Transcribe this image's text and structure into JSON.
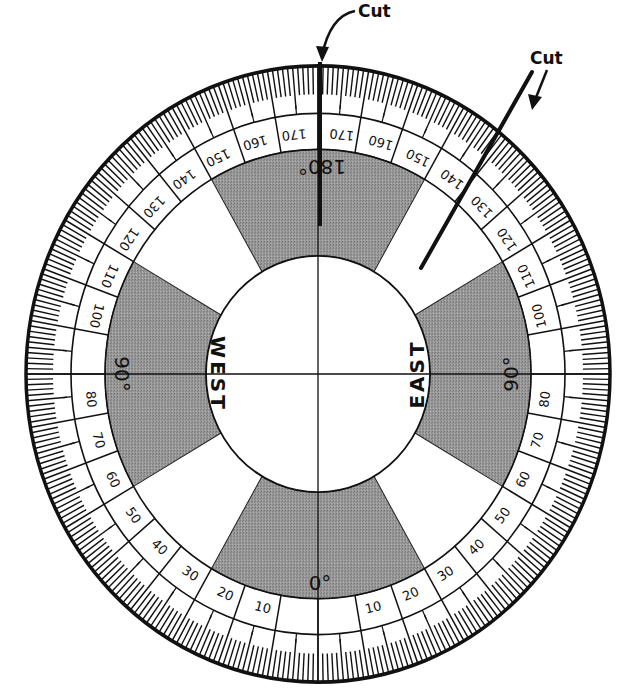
{
  "diagram": {
    "type": "circular-protractor-dial",
    "callouts": [
      {
        "id": "cut-top",
        "label": "Cut",
        "text_x": 358,
        "text_y": 18
      },
      {
        "id": "cut-right",
        "label": "Cut",
        "text_x": 510,
        "text_y": 65
      }
    ],
    "cardinal_labels": {
      "west": "WEST",
      "east": "EAST"
    },
    "degree_markers": {
      "bottom": "0°",
      "left": "90°",
      "right": "90°",
      "top": "180°"
    },
    "scale": {
      "left_labels": [
        "10",
        "20",
        "30",
        "40",
        "50",
        "60",
        "70",
        "80",
        "100",
        "110",
        "120",
        "130",
        "140",
        "150",
        "160",
        "170"
      ],
      "right_labels": [
        "10",
        "20",
        "30",
        "40",
        "50",
        "60",
        "70",
        "80",
        "100",
        "110",
        "120",
        "130",
        "140",
        "150",
        "160",
        "170"
      ],
      "label_values": [
        10,
        20,
        30,
        40,
        50,
        60,
        70,
        80,
        100,
        110,
        120,
        130,
        140,
        150,
        160,
        170
      ],
      "minor_tick_step_deg": 1,
      "major_tick_step_deg": 5
    },
    "shaded_sectors_deg": [
      [
        -30,
        30
      ],
      [
        60,
        120
      ],
      [
        150,
        210
      ],
      [
        240,
        300
      ]
    ],
    "colors": {
      "ink": "#111111",
      "shade": "#8f8f8f",
      "paper": "#ffffff"
    }
  }
}
